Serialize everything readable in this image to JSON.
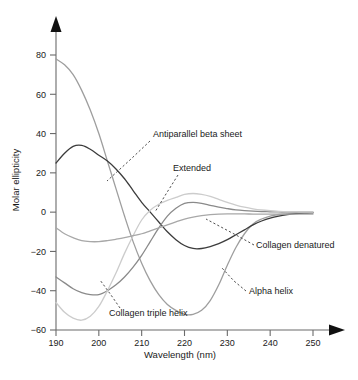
{
  "chart_data": {
    "type": "line",
    "title": "",
    "xlabel": "Wavelength (nm)",
    "ylabel": "Molar ellipticity",
    "xlim": [
      190,
      250
    ],
    "ylim": [
      -60,
      90
    ],
    "xticks": [
      190,
      200,
      210,
      220,
      230,
      240,
      250
    ],
    "yticks": [
      -60,
      -40,
      -20,
      0,
      20,
      40,
      60,
      80
    ],
    "grid": false,
    "legend_position": "inline-annotations",
    "x": [
      190,
      192,
      194,
      196,
      198,
      200,
      202,
      204,
      206,
      208,
      210,
      212,
      214,
      216,
      218,
      220,
      222,
      224,
      226,
      228,
      230,
      232,
      234,
      236,
      238,
      240,
      242,
      244,
      246,
      248,
      250
    ],
    "series": [
      {
        "name": "Alpha helix",
        "color": "#9e9e9e",
        "values": [
          78,
          75,
          70,
          62,
          52,
          40,
          26,
          12,
          -2,
          -15,
          -26,
          -35,
          -42,
          -47,
          -50,
          -52,
          -52,
          -50,
          -45,
          -37,
          -27,
          -18,
          -11,
          -6,
          -3.5,
          -2,
          -1.2,
          -0.8,
          -0.5,
          -0.3,
          -0.2
        ]
      },
      {
        "name": "Antiparallel beta sheet",
        "color": "#3c3c3c",
        "values": [
          25,
          30,
          33.5,
          34,
          32,
          29,
          26,
          22,
          17,
          11,
          5,
          0,
          -5,
          -10,
          -14,
          -17,
          -18.5,
          -18.5,
          -17.5,
          -16,
          -14,
          -11.5,
          -9,
          -6.5,
          -4.5,
          -3,
          -2,
          -1.3,
          -0.8,
          -0.5,
          -0.3
        ]
      },
      {
        "name": "Extended",
        "color": "#8a8a8a",
        "values": [
          -33,
          -36,
          -39,
          -41,
          -42,
          -42,
          -40,
          -37,
          -33,
          -28,
          -22,
          -15,
          -8,
          -2,
          2,
          4.5,
          5,
          4.5,
          3.5,
          2.5,
          1.8,
          1.2,
          0.8,
          0.5,
          0.3,
          0.2,
          0.1,
          0,
          0,
          0,
          0
        ]
      },
      {
        "name": "Collagen triple helix",
        "color": "#cccccc",
        "values": [
          -46,
          -51,
          -54,
          -55,
          -53,
          -48,
          -40,
          -31,
          -21,
          -12,
          -4,
          1,
          4,
          6,
          7.5,
          9,
          9.5,
          9,
          8,
          6.5,
          5,
          3.6,
          2.5,
          1.7,
          1.1,
          0.7,
          0.4,
          0.2,
          0.1,
          0,
          0
        ]
      },
      {
        "name": "Collagen denatured",
        "color": "#a8a8a8",
        "values": [
          -8,
          -11,
          -13,
          -14.5,
          -15,
          -15,
          -14.5,
          -13.8,
          -13,
          -12,
          -11,
          -9.5,
          -8,
          -6.5,
          -5,
          -3.5,
          -2.5,
          -1.8,
          -1.3,
          -1,
          -0.9,
          -0.9,
          -0.9,
          -1,
          -1,
          -1,
          -1,
          -1,
          -1,
          -1,
          -1
        ]
      }
    ],
    "annotations": [
      {
        "name": "antiparallel-beta-sheet",
        "label": "Antiparallel beta sheet",
        "text_x": 153,
        "text_y": 137,
        "anchor": "start",
        "leader": "M 150,141 L 131,159 L 107,181"
      },
      {
        "name": "extended",
        "label": "Extended",
        "text_x": 173,
        "text_y": 171,
        "anchor": "start",
        "leader": "M 178,175 L 166,194 L 155,212"
      },
      {
        "name": "collagen-denatured",
        "label": "Collagen denatured",
        "text_x": 256,
        "text_y": 248,
        "anchor": "start",
        "leader": "M 254,245 L 236,235 L 206,219"
      },
      {
        "name": "alpha-helix",
        "label": "Alpha helix",
        "text_x": 249,
        "text_y": 294,
        "anchor": "start",
        "leader": "M 246,291 L 234,281 L 222,268"
      },
      {
        "name": "collagen-triple-helix",
        "label": "Collagen triple helix",
        "text_x": 109,
        "text_y": 316,
        "anchor": "start",
        "leader": "M 120,308 L 111,295 L 100,280"
      }
    ]
  },
  "axes": {
    "xlabel": "Wavelength (nm)",
    "ylabel": "Molar ellipticity",
    "xticks": [
      "190",
      "200",
      "210",
      "220",
      "230",
      "240",
      "250"
    ],
    "yticks": [
      "80",
      "60",
      "40",
      "20",
      "0",
      "-20",
      "-40",
      "-60"
    ]
  },
  "caption": {
    "text": "                                                                                       "
  }
}
